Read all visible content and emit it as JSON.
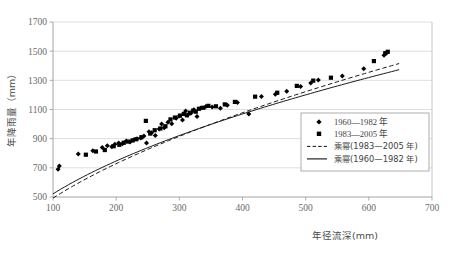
{
  "chart_data": {
    "type": "scatter",
    "title": "",
    "xlabel": "年径流深(mm)",
    "ylabel": "年降雨量（mm）",
    "xlim": [
      100,
      700
    ],
    "ylim": [
      500,
      1700
    ],
    "xticks": [
      "100",
      "200",
      "300",
      "400",
      "500",
      "600",
      "700"
    ],
    "yticks": [
      "500",
      "700",
      "900",
      "1100",
      "1300",
      "1500",
      "1700"
    ],
    "xtick_values": [
      100,
      200,
      300,
      400,
      500,
      600,
      700
    ],
    "ytick_values": [
      500,
      700,
      900,
      1100,
      1300,
      1500,
      1700
    ],
    "grid": "horizontal",
    "legend_position": "inside-lower-right",
    "series": [
      {
        "name": "1960—1982 年",
        "marker": "diamond",
        "color": "#000000",
        "points": [
          [
            108,
            690
          ],
          [
            110,
            712
          ],
          [
            140,
            795
          ],
          [
            163,
            818
          ],
          [
            178,
            840
          ],
          [
            186,
            852
          ],
          [
            193,
            845
          ],
          [
            198,
            862
          ],
          [
            204,
            870
          ],
          [
            210,
            866
          ],
          [
            216,
            884
          ],
          [
            222,
            878
          ],
          [
            228,
            892
          ],
          [
            233,
            900
          ],
          [
            239,
            905
          ],
          [
            244,
            918
          ],
          [
            248,
            870
          ],
          [
            252,
            948
          ],
          [
            256,
            940
          ],
          [
            262,
            922
          ],
          [
            268,
            966
          ],
          [
            272,
            1000
          ],
          [
            276,
            975
          ],
          [
            282,
            1012
          ],
          [
            288,
            1002
          ],
          [
            295,
            1040
          ],
          [
            300,
            1055
          ],
          [
            305,
            1028
          ],
          [
            310,
            1090
          ],
          [
            314,
            1065
          ],
          [
            318,
            1075
          ],
          [
            323,
            1098
          ],
          [
            328,
            1052
          ],
          [
            334,
            1110
          ],
          [
            342,
            1120
          ],
          [
            352,
            1118
          ],
          [
            365,
            1108
          ],
          [
            376,
            1130
          ],
          [
            392,
            1148
          ],
          [
            410,
            1070
          ],
          [
            430,
            1190
          ],
          [
            452,
            1205
          ],
          [
            470,
            1225
          ],
          [
            492,
            1258
          ],
          [
            508,
            1282
          ],
          [
            520,
            1302
          ],
          [
            558,
            1330
          ],
          [
            592,
            1380
          ],
          [
            624,
            1472
          ],
          [
            628,
            1490
          ]
        ]
      },
      {
        "name": "1983—2005 年",
        "marker": "square",
        "color": "#000000",
        "points": [
          [
            152,
            790
          ],
          [
            168,
            812
          ],
          [
            182,
            822
          ],
          [
            196,
            848
          ],
          [
            205,
            858
          ],
          [
            212,
            872
          ],
          [
            219,
            880
          ],
          [
            226,
            888
          ],
          [
            232,
            896
          ],
          [
            240,
            910
          ],
          [
            247,
            1022
          ],
          [
            254,
            935
          ],
          [
            261,
            958
          ],
          [
            270,
            970
          ],
          [
            278,
            985
          ],
          [
            286,
            1032
          ],
          [
            293,
            1045
          ],
          [
            301,
            1058
          ],
          [
            307,
            1070
          ],
          [
            312,
            1060
          ],
          [
            317,
            1078
          ],
          [
            322,
            1092
          ],
          [
            326,
            1085
          ],
          [
            331,
            1105
          ],
          [
            338,
            1112
          ],
          [
            346,
            1125
          ],
          [
            358,
            1122
          ],
          [
            372,
            1135
          ],
          [
            388,
            1152
          ],
          [
            420,
            1188
          ],
          [
            455,
            1215
          ],
          [
            486,
            1262
          ],
          [
            512,
            1298
          ],
          [
            540,
            1318
          ],
          [
            608,
            1432
          ],
          [
            626,
            1486
          ],
          [
            630,
            1496
          ]
        ]
      }
    ],
    "trendlines": [
      {
        "name": "乘幂(1983—2005 年)",
        "style": "dashed",
        "color": "#000000",
        "fit": "power",
        "a": 36.5,
        "b": 0.565
      },
      {
        "name": "乘幂(1960—1982 年)",
        "style": "solid",
        "color": "#000000",
        "fit": "power",
        "a": 48.0,
        "b": 0.518
      }
    ],
    "legend": [
      {
        "label": "1960—1982 年",
        "marker": "diamond",
        "kind": "marker"
      },
      {
        "label": "1983—2005 年",
        "marker": "square",
        "kind": "marker"
      },
      {
        "label": "乘幂(1983—2005 年)",
        "marker": "dashed-line",
        "kind": "line"
      },
      {
        "label": "乘幂(1960—1982 年)",
        "marker": "solid-line",
        "kind": "line"
      }
    ]
  },
  "colors": {
    "axis": "#9a9a9a",
    "grid": "#d6d6d6",
    "marker": "#000000",
    "text": "#555555",
    "background": "#ffffff"
  }
}
